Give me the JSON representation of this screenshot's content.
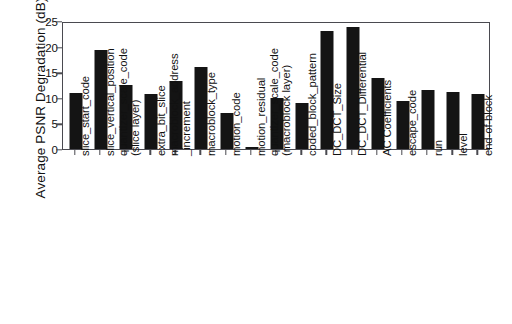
{
  "chart_data": {
    "type": "bar",
    "title": "",
    "xlabel": "",
    "ylabel": "Average PSNR Degradation (dB)",
    "ylim": [
      0,
      25
    ],
    "yticks": [
      0,
      5,
      10,
      15,
      20,
      25
    ],
    "grid": false,
    "legend": null,
    "bar_color": "#141414",
    "axis_color": "#4a4a50",
    "categories": [
      "slice_start_code",
      "slice_vertical_position",
      "quantizer_scale_code (slice layer)",
      "extra_bit_slice",
      "macroblock_address_increment",
      "macroblock_type",
      "motion_code",
      "motion_residual",
      "quantizer_scale_code (macroblock layer)",
      "coded_block_pattern",
      "DC_DCT_Size",
      "DC_DCT_Differential",
      "AC Coefficients",
      "escape_code",
      "run",
      "level",
      "end-of-block"
    ],
    "category_lines": [
      [
        "slice_start_code"
      ],
      [
        "slice_vertical_position"
      ],
      [
        "quantizer_scale_code",
        "(slice layer)"
      ],
      [
        "extra_bit_slice"
      ],
      [
        "macroblock_address",
        "_increment"
      ],
      [
        "macroblock_type"
      ],
      [
        "motion_code"
      ],
      [
        "motion_residual"
      ],
      [
        "quantizer_scale_code",
        "(macroblock layer)"
      ],
      [
        "coded_block_pattern"
      ],
      [
        "DC_DCT_Size"
      ],
      [
        "DC_DCT_Differential"
      ],
      [
        "AC Coefficients"
      ],
      [
        "escape_code"
      ],
      [
        "run"
      ],
      [
        "level"
      ],
      [
        "end-of-block"
      ]
    ],
    "values": [
      10.9,
      19.3,
      12.5,
      10.7,
      13.3,
      16.0,
      7.0,
      0.3,
      10.0,
      8.9,
      23.1,
      23.9,
      13.8,
      9.4,
      11.5,
      11.1,
      10.8
    ]
  }
}
